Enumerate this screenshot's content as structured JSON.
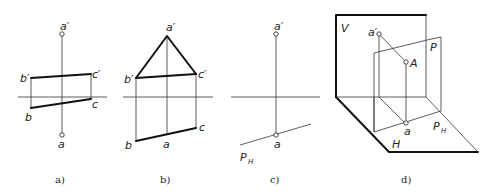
{
  "figure": {
    "panels": [
      {
        "id": "a",
        "caption": "a)",
        "labels": {
          "a_prime": "a′",
          "b_prime": "b′",
          "c_prime": "c′",
          "b": "b",
          "c": "c",
          "a": "a"
        }
      },
      {
        "id": "b",
        "caption": "b)",
        "labels": {
          "a_prime": "a′",
          "b_prime": "b′",
          "c_prime": "c′",
          "b": "b",
          "c": "c",
          "a": "a"
        }
      },
      {
        "id": "c",
        "caption": "c)",
        "labels": {
          "a_prime": "a′",
          "a": "a",
          "trace": "P",
          "trace_sub": "H"
        }
      },
      {
        "id": "d",
        "caption": "d)",
        "labels": {
          "V": "V",
          "H": "H",
          "P": "P",
          "A": "A",
          "a_prime": "a′",
          "a": "a",
          "trace": "P",
          "trace_sub": "H"
        }
      }
    ]
  }
}
